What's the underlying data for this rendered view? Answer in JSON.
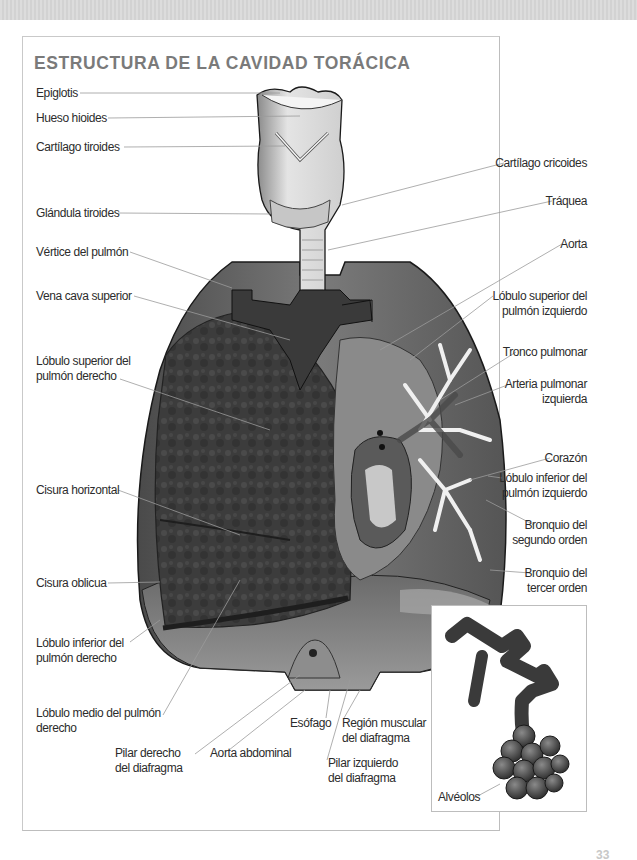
{
  "page": {
    "title": "ESTRUCTURA DE LA CAVIDAD TORÁCICA",
    "page_number": "33"
  },
  "labels_left": [
    {
      "id": "epiglotis",
      "text": "Epiglotis"
    },
    {
      "id": "hueso-hioides",
      "text": "Hueso hioides"
    },
    {
      "id": "cartilago-tiroides",
      "text": "Cartílago tiroides"
    },
    {
      "id": "glandula-tiroides",
      "text": "Glándula tiroides"
    },
    {
      "id": "vertice-pulmon",
      "text": "Vértice del pulmón"
    },
    {
      "id": "vena-cava-superior",
      "text": "Vena cava superior"
    },
    {
      "id": "lobulo-superior-derecho",
      "line1": "Lóbulo superior del",
      "line2": "pulmón derecho"
    },
    {
      "id": "cisura-horizontal",
      "text": "Cisura horizontal"
    },
    {
      "id": "cisura-oblicua",
      "text": "Cisura oblicua"
    },
    {
      "id": "lobulo-inferior-derecho",
      "line1": "Lóbulo inferior del",
      "line2": "pulmón derecho"
    },
    {
      "id": "lobulo-medio-derecho",
      "line1": "Lóbulo medio del pulmón",
      "line2": "derecho"
    }
  ],
  "labels_right": [
    {
      "id": "cartilago-cricoides",
      "text": "Cartílago cricoides"
    },
    {
      "id": "traquea",
      "text": "Tráquea"
    },
    {
      "id": "aorta",
      "text": "Aorta"
    },
    {
      "id": "lobulo-superior-izquierdo",
      "line1": "Lóbulo superior del",
      "line2": "pulmón izquierdo"
    },
    {
      "id": "tronco-pulmonar",
      "text": "Tronco pulmonar"
    },
    {
      "id": "arteria-pulmonar-izquierda",
      "line1": "Arteria pulmonar",
      "line2": "izquierda"
    },
    {
      "id": "corazon",
      "text": "Corazón"
    },
    {
      "id": "lobulo-inferior-izquierdo",
      "line1": "Lóbulo inferior del",
      "line2": "pulmón izquierdo"
    },
    {
      "id": "bronquio-segundo-orden",
      "line1": "Bronquio del",
      "line2": "segundo orden"
    },
    {
      "id": "bronquio-tercer-orden",
      "line1": "Bronquio del",
      "line2": "tercer orden"
    }
  ],
  "labels_bottom": [
    {
      "id": "pilar-derecho",
      "line1": "Pilar derecho",
      "line2": "del diafragma"
    },
    {
      "id": "aorta-abdominal",
      "text": "Aorta abdominal"
    },
    {
      "id": "esofago",
      "text": "Esófago"
    },
    {
      "id": "region-muscular",
      "line1": "Región muscular",
      "line2": "del diafragma"
    },
    {
      "id": "pilar-izquierdo",
      "line1": "Pilar izquierdo",
      "line2": "del diafragma"
    }
  ],
  "inset": {
    "label": "Alvéolos"
  },
  "colors": {
    "title": "#7a7a7a",
    "leader_line": "#9a9a9a",
    "frame_border": "#c9c9c9",
    "lung_dark": "#3a3a3a",
    "lung_mid": "#6e6e6e",
    "tissue_light": "#d8d8d8"
  }
}
